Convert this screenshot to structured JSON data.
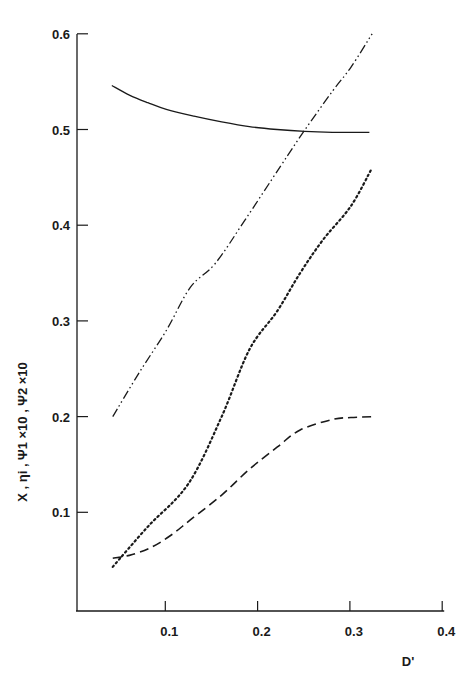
{
  "chart_data": {
    "type": "line",
    "title": "",
    "xlabel": "D'",
    "ylabel": "X , ηi , Ψ1 ×10 , Ψ2 ×10",
    "xlim": [
      0,
      0.4
    ],
    "ylim": [
      0,
      0.6
    ],
    "x_ticks": [
      "0.1",
      "0.2",
      "0.3",
      "0.4"
    ],
    "y_ticks": [
      "0.1",
      "0.2",
      "0.3",
      "0.4",
      "0.5",
      "0.6"
    ],
    "grid": false,
    "legend": "none",
    "series": [
      {
        "name": "solid",
        "style": "solid",
        "x": [
          0.041,
          0.06,
          0.08,
          0.1,
          0.13,
          0.16,
          0.19,
          0.22,
          0.25,
          0.28,
          0.3,
          0.32
        ],
        "y": [
          0.546,
          0.536,
          0.528,
          0.521,
          0.514,
          0.508,
          0.503,
          0.5,
          0.498,
          0.497,
          0.497,
          0.497
        ]
      },
      {
        "name": "dash-dot",
        "style": "dashdotdot",
        "x": [
          0.042,
          0.07,
          0.1,
          0.126,
          0.153,
          0.185,
          0.224,
          0.249,
          0.28,
          0.3,
          0.323
        ],
        "y": [
          0.2,
          0.245,
          0.29,
          0.335,
          0.36,
          0.405,
          0.462,
          0.498,
          0.54,
          0.565,
          0.6
        ]
      },
      {
        "name": "dotted",
        "style": "dotted",
        "x": [
          0.042,
          0.08,
          0.124,
          0.16,
          0.19,
          0.22,
          0.245,
          0.27,
          0.3,
          0.323
        ],
        "y": [
          0.043,
          0.085,
          0.13,
          0.2,
          0.27,
          0.31,
          0.35,
          0.385,
          0.42,
          0.46
        ]
      },
      {
        "name": "dashed",
        "style": "dashed",
        "x": [
          0.042,
          0.06,
          0.083,
          0.105,
          0.126,
          0.16,
          0.19,
          0.22,
          0.245,
          0.28,
          0.3,
          0.327
        ],
        "y": [
          0.052,
          0.055,
          0.063,
          0.076,
          0.092,
          0.118,
          0.145,
          0.168,
          0.186,
          0.197,
          0.199,
          0.2
        ]
      }
    ]
  },
  "colors": {
    "ink": "#1a1a1a",
    "background": "#ffffff"
  }
}
